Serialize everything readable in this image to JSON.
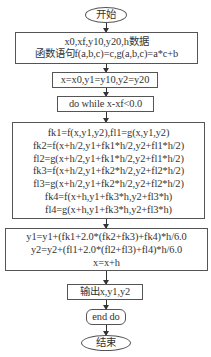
{
  "flowchart": {
    "start": {
      "label": "开始"
    },
    "input": {
      "lines": [
        "x0,xf,y10,y20,h数据",
        "函数语句f(a,b,c)=c,g(a,b,c)=a*c+b"
      ]
    },
    "init": {
      "label": "x=x0,y1=y10,y2=y20"
    },
    "loop": {
      "label": "do while x-xf<0.0"
    },
    "compute": {
      "lines": [
        "fk1=f(x,y1,y2),fl1=g(x,y1,y2)",
        "fk2=f(x+h/2,y1+fk1*h/2,y2+fl1*h/2)",
        "fl2=g(x+h/2,y1+fk1*h/2,y2+fl1*h/2)",
        "fk3=f(x+h/2,y1+fk2*h/2,y2+fl2*h/2)",
        "fl3=g(x+h/2,y1+fk2*h/2,y2+fl2*h/2)",
        "fk4=f(x+h,y1+fk3*h,y2+fl3*h)",
        "fl4=g(x+h,y1+fk3*h,y2+fl3*h)"
      ]
    },
    "update": {
      "lines": [
        "y1=y1+(fk1+2.0*(fk2+fk3)+fk4)*h/6.0",
        "y2=y2+(fl1+2.0*(fl2+fl3)+fl4)*h/6.0",
        "x=x+h"
      ]
    },
    "output": {
      "label": "输出x,y1,y2"
    },
    "end_loop": {
      "label": "end do"
    },
    "end": {
      "label": "结束"
    }
  }
}
